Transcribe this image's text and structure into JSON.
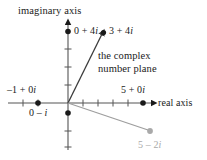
{
  "figure": {
    "caption_present": false,
    "background": "#ffffff",
    "ink_color": "#1a1a1a",
    "accent_gray": "#a9a9a9"
  },
  "axes": {
    "imaginary_label": "imaginary axis",
    "real_label": "real axis"
  },
  "annotation": {
    "line1": "the complex",
    "line2": "number plane"
  },
  "labels": {
    "p_3_4i": "3 + 4i",
    "p_0_4i": "0 + 4i",
    "p_neg1_0i": "–1 + 0i",
    "p_0_minus_i": "0 – i",
    "p_5_0i": "5 + 0i",
    "p_5_minus_2i": "5 – 2i"
  },
  "chart_data": {
    "type": "scatter",
    "title": "",
    "xlabel": "real axis",
    "ylabel": "imaginary axis",
    "xlim": [
      -3,
      7
    ],
    "ylim": [
      -3,
      5
    ],
    "grid": false,
    "legend": "none",
    "points": [
      {
        "name": "3 + 4i",
        "x": 3,
        "y": 4,
        "color": "#1a1a1a",
        "vector_from_origin": true
      },
      {
        "name": "0 + 4i",
        "x": 0,
        "y": 4,
        "color": "#1a1a1a",
        "vector_from_origin": false
      },
      {
        "name": "-1 + 0i",
        "x": -1,
        "y": 0,
        "color": "#1a1a1a",
        "vector_from_origin": false
      },
      {
        "name": "0 - i",
        "x": 0,
        "y": -1,
        "color": "#1a1a1a",
        "vector_from_origin": false
      },
      {
        "name": "5 + 0i",
        "x": 5,
        "y": 0,
        "color": "#1a1a1a",
        "vector_from_origin": false
      },
      {
        "name": "5 - 2i",
        "x": 5,
        "y": -2,
        "color": "#a9a9a9",
        "vector_from_origin": true
      }
    ],
    "xticks": [
      -2,
      -1,
      1,
      2,
      3,
      4,
      5
    ],
    "yticks": [
      -3,
      -2,
      -1,
      1,
      2,
      3,
      4
    ],
    "annotations": [
      "the complex number plane"
    ]
  }
}
